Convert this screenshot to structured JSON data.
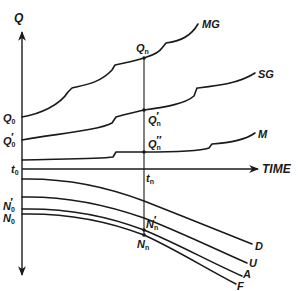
{
  "diagram": {
    "axes": {
      "vertical_label": "Q",
      "horizontal_label": "TIME"
    },
    "time_markers": {
      "start": {
        "base": "t",
        "sub": "0"
      },
      "end": {
        "base": "t",
        "sub": "n"
      }
    },
    "upper_curves": [
      {
        "id": "MG",
        "label": "MG"
      },
      {
        "id": "SG",
        "label": "SG"
      },
      {
        "id": "M",
        "label": "M"
      }
    ],
    "lower_curves": [
      {
        "id": "D",
        "label": "D"
      },
      {
        "id": "U",
        "label": "U"
      },
      {
        "id": "A",
        "label": "A"
      },
      {
        "id": "F",
        "label": "F"
      }
    ],
    "left_labels": {
      "Q0": {
        "base": "Q",
        "sub": "0",
        "prime": ""
      },
      "Q0p": {
        "base": "Q",
        "sub": "0",
        "prime": "′"
      },
      "N0p": {
        "base": "N",
        "sub": "0",
        "prime": "′"
      },
      "N0": {
        "base": "N",
        "sub": "0",
        "prime": ""
      }
    },
    "right_labels": {
      "Qn": {
        "base": "Q",
        "sub": "n",
        "prime": ""
      },
      "Qnp": {
        "base": "Q",
        "sub": "n",
        "prime": "′"
      },
      "Qnpp": {
        "base": "Q",
        "sub": "n",
        "prime": "″"
      },
      "Nnp": {
        "base": "N",
        "sub": "n",
        "prime": "′"
      },
      "Nn": {
        "base": "N",
        "sub": "n",
        "prime": ""
      }
    },
    "colors": {
      "ink": "#1a1a1a",
      "background": "#ffffff"
    }
  }
}
